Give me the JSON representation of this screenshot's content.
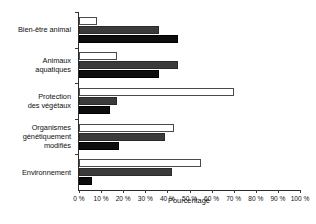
{
  "chart_data": {
    "type": "bar",
    "orientation": "horizontal",
    "title": "",
    "xlabel": "Pourcentage",
    "ylabel": "",
    "xlim": [
      0,
      100
    ],
    "grid": false,
    "legend": "none",
    "categories": [
      "Bien-être animal",
      "Animaux\naquatiques",
      "Protection\ndes végétaux",
      "Organismes\ngénétiquement\nmodifiés",
      "Environnement"
    ],
    "tick_labels": [
      "0 %",
      "10 %",
      "20 %",
      "30 %",
      "40 %",
      "50 %",
      "60 %",
      "70 %",
      "80 %",
      "90 %",
      "100 %"
    ],
    "tick_values": [
      0,
      10,
      20,
      30,
      40,
      50,
      60,
      70,
      80,
      90,
      100
    ],
    "series": [
      {
        "name": "serie-1",
        "color": "#ffffff",
        "values": [
          8,
          17,
          70,
          43,
          55
        ]
      },
      {
        "name": "serie-2",
        "color": "#3b3b3b",
        "values": [
          36,
          45,
          17,
          39,
          42
        ]
      },
      {
        "name": "serie-3",
        "color": "#0d0d0d",
        "values": [
          45,
          36,
          14,
          18,
          6
        ]
      }
    ]
  }
}
